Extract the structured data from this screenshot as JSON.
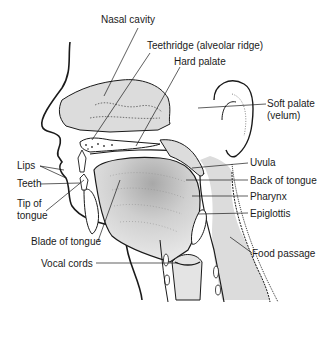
{
  "figure": {
    "labels": {
      "nasal_cavity": "Nasal cavity",
      "teethridge": "Teethridge (alveolar ridge)",
      "hard_palate": "Hard palate",
      "soft_palate_1": "Soft palate",
      "soft_palate_2": "(velum)",
      "uvula": "Uvula",
      "back_of_tongue": "Back of tongue",
      "pharynx": "Pharynx",
      "epiglottis": "Epiglottis",
      "food_passage": "Food passage",
      "lips": "Lips",
      "teeth": "Teeth",
      "tip_of_tongue_1": "Tip of",
      "tip_of_tongue_2": "tongue",
      "blade_of_tongue": "Blade of tongue",
      "vocal_cords": "Vocal cords"
    },
    "colors": {
      "line": "#1a1a1a",
      "fill": "#dcdcdc",
      "fill_dark": "#b8b8b8",
      "background": "#ffffff"
    }
  }
}
